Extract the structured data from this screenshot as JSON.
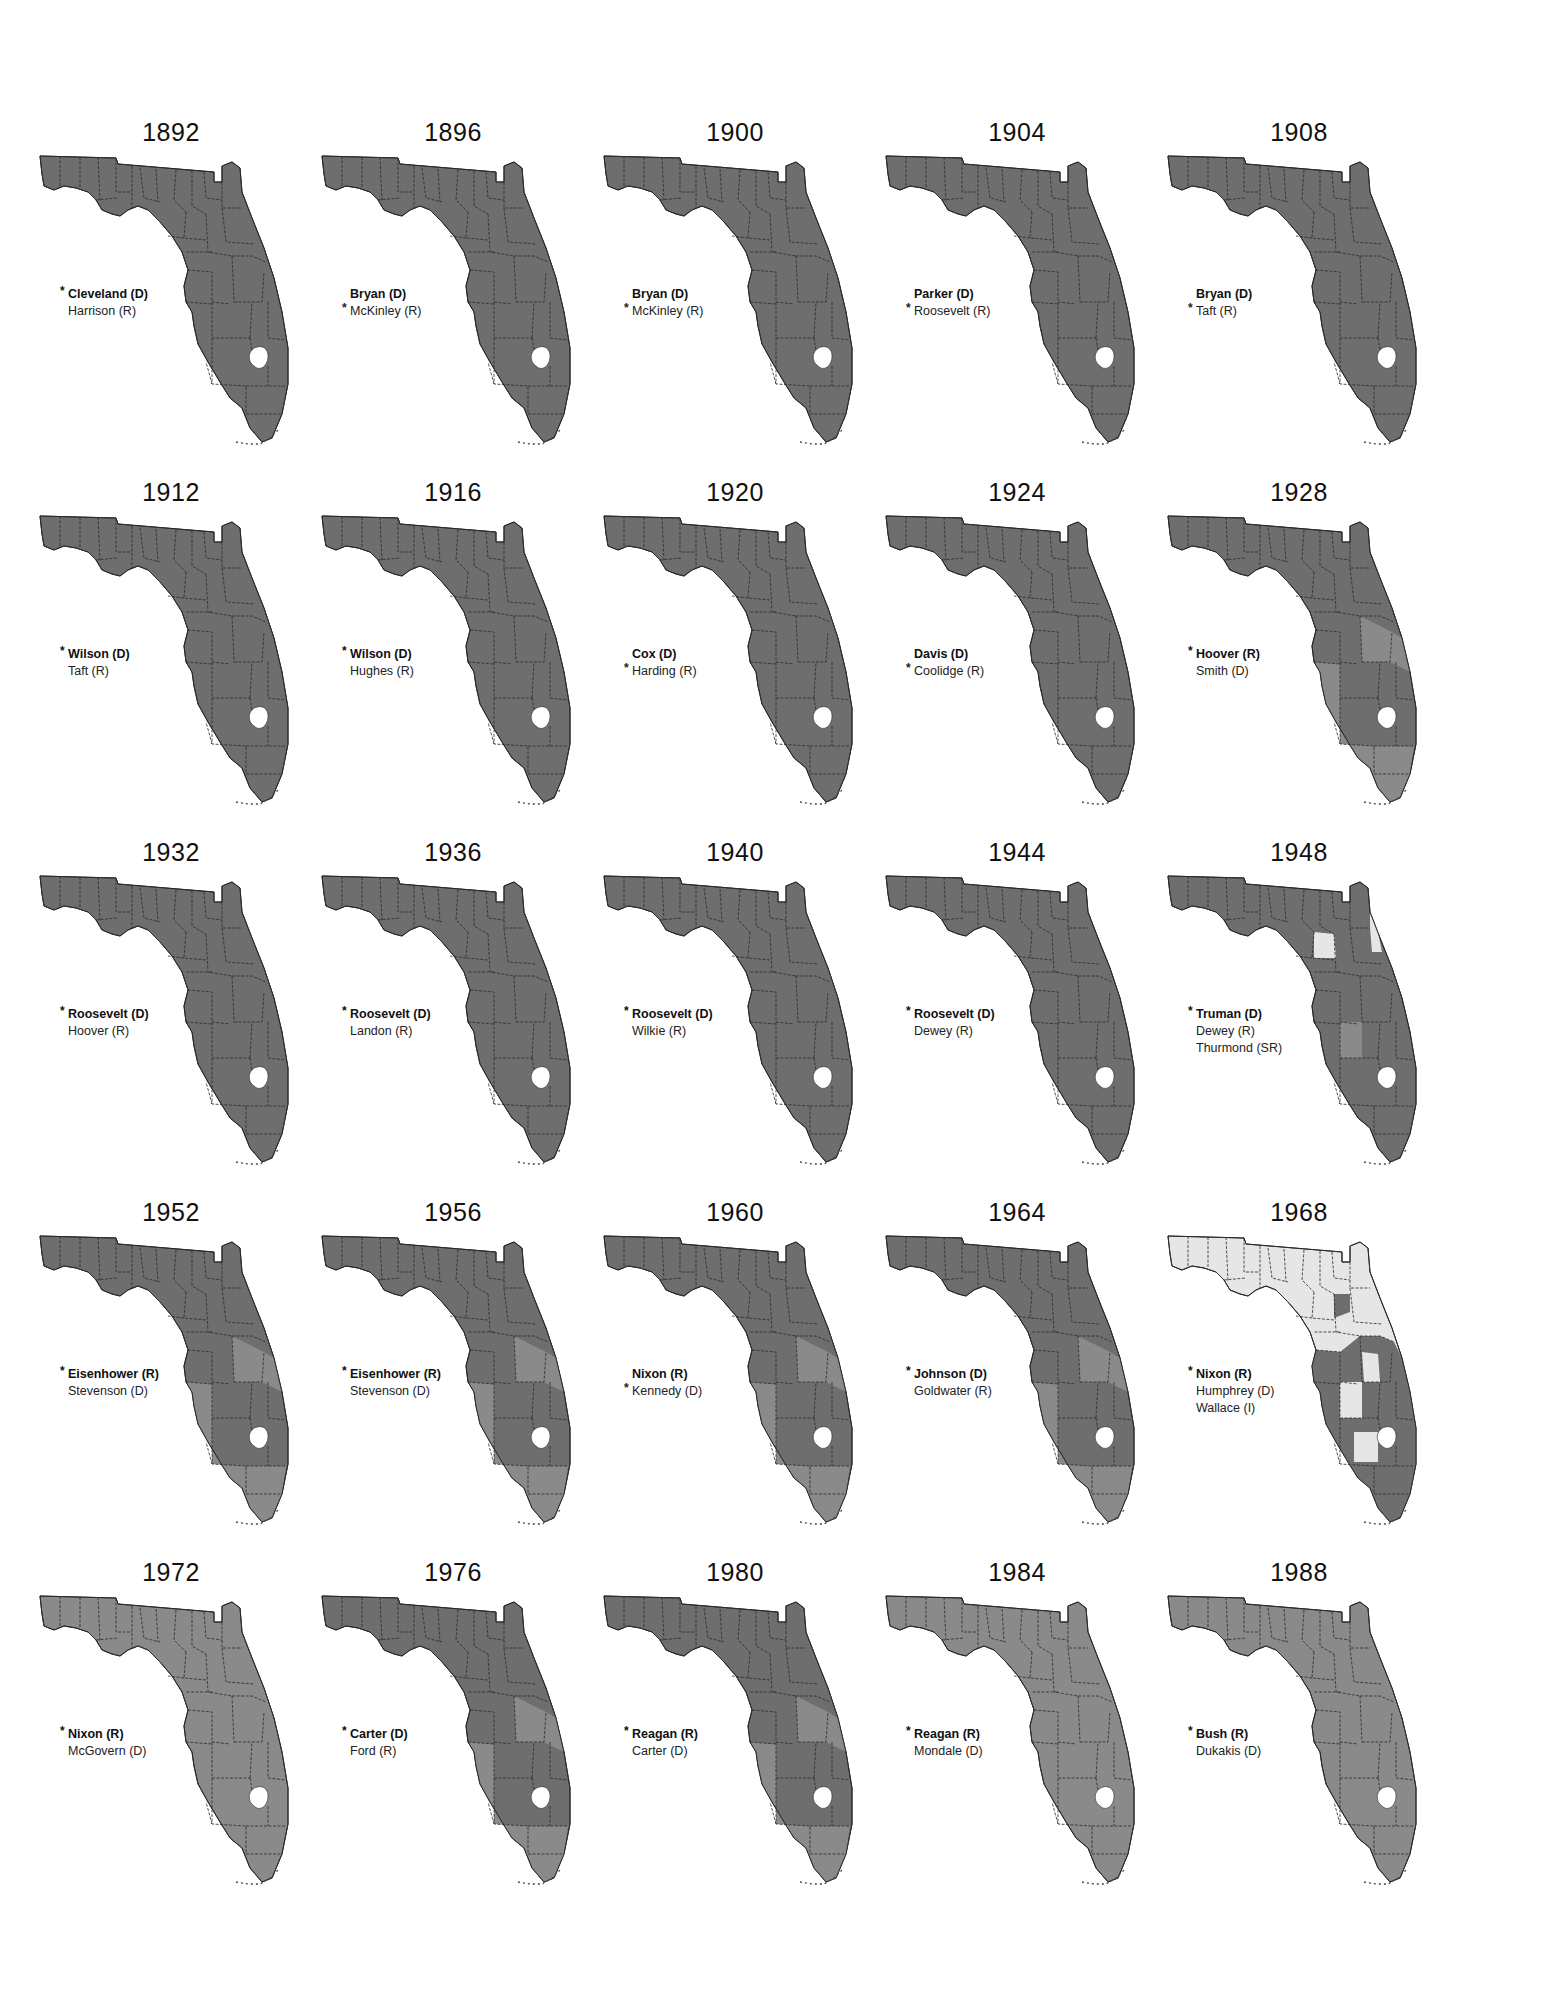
{
  "figure": {
    "winner_marker": "*",
    "colors": {
      "dark": "#6e6e6e",
      "medium": "#8a8a8a",
      "light": "#e6e6e6",
      "border": "#2a2a2a",
      "lake": "#ffffff"
    }
  },
  "elections": [
    {
      "year": "1892",
      "candidates": [
        {
          "name": "Cleveland (D)",
          "winner": true,
          "bold": true
        },
        {
          "name": "Harrison (R)",
          "winner": false,
          "bold": false
        }
      ],
      "shade": "dark"
    },
    {
      "year": "1896",
      "candidates": [
        {
          "name": "Bryan (D)",
          "winner": false,
          "bold": true
        },
        {
          "name": "McKinley (R)",
          "winner": true,
          "bold": false
        }
      ],
      "shade": "dark"
    },
    {
      "year": "1900",
      "candidates": [
        {
          "name": "Bryan (D)",
          "winner": false,
          "bold": true
        },
        {
          "name": "McKinley (R)",
          "winner": true,
          "bold": false
        }
      ],
      "shade": "dark"
    },
    {
      "year": "1904",
      "candidates": [
        {
          "name": "Parker (D)",
          "winner": false,
          "bold": true
        },
        {
          "name": "Roosevelt (R)",
          "winner": true,
          "bold": false
        }
      ],
      "shade": "dark"
    },
    {
      "year": "1908",
      "candidates": [
        {
          "name": "Bryan (D)",
          "winner": false,
          "bold": true
        },
        {
          "name": "Taft (R)",
          "winner": true,
          "bold": false
        }
      ],
      "shade": "dark"
    },
    {
      "year": "1912",
      "candidates": [
        {
          "name": "Wilson (D)",
          "winner": true,
          "bold": true
        },
        {
          "name": "Taft (R)",
          "winner": false,
          "bold": false
        }
      ],
      "shade": "dark"
    },
    {
      "year": "1916",
      "candidates": [
        {
          "name": "Wilson (D)",
          "winner": true,
          "bold": true
        },
        {
          "name": "Hughes (R)",
          "winner": false,
          "bold": false
        }
      ],
      "shade": "dark"
    },
    {
      "year": "1920",
      "candidates": [
        {
          "name": "Cox (D)",
          "winner": false,
          "bold": true
        },
        {
          "name": "Harding (R)",
          "winner": true,
          "bold": false
        }
      ],
      "shade": "dark"
    },
    {
      "year": "1924",
      "candidates": [
        {
          "name": "Davis (D)",
          "winner": false,
          "bold": true
        },
        {
          "name": "Coolidge (R)",
          "winner": true,
          "bold": false
        }
      ],
      "shade": "dark"
    },
    {
      "year": "1928",
      "candidates": [
        {
          "name": "Hoover (R)",
          "winner": true,
          "bold": true
        },
        {
          "name": "Smith (D)",
          "winner": false,
          "bold": false
        }
      ],
      "shade": "mixed"
    },
    {
      "year": "1932",
      "candidates": [
        {
          "name": "Roosevelt (D)",
          "winner": true,
          "bold": true
        },
        {
          "name": "Hoover (R)",
          "winner": false,
          "bold": false
        }
      ],
      "shade": "dark"
    },
    {
      "year": "1936",
      "candidates": [
        {
          "name": "Roosevelt (D)",
          "winner": true,
          "bold": true
        },
        {
          "name": "Landon (R)",
          "winner": false,
          "bold": false
        }
      ],
      "shade": "dark"
    },
    {
      "year": "1940",
      "candidates": [
        {
          "name": "Roosevelt (D)",
          "winner": true,
          "bold": true
        },
        {
          "name": "Wilkie (R)",
          "winner": false,
          "bold": false
        }
      ],
      "shade": "dark"
    },
    {
      "year": "1944",
      "candidates": [
        {
          "name": "Roosevelt (D)",
          "winner": true,
          "bold": true
        },
        {
          "name": "Dewey (R)",
          "winner": false,
          "bold": false
        }
      ],
      "shade": "dark"
    },
    {
      "year": "1948",
      "candidates": [
        {
          "name": "Truman (D)",
          "winner": true,
          "bold": true
        },
        {
          "name": "Dewey (R)",
          "winner": false,
          "bold": false
        },
        {
          "name": "Thurmond (SR)",
          "winner": false,
          "bold": false
        }
      ],
      "shade": "dark-with-light"
    },
    {
      "year": "1952",
      "candidates": [
        {
          "name": "Eisenhower (R)",
          "winner": true,
          "bold": true
        },
        {
          "name": "Stevenson (D)",
          "winner": false,
          "bold": false
        }
      ],
      "shade": "mixed"
    },
    {
      "year": "1956",
      "candidates": [
        {
          "name": "Eisenhower (R)",
          "winner": true,
          "bold": true
        },
        {
          "name": "Stevenson (D)",
          "winner": false,
          "bold": false
        }
      ],
      "shade": "mixed"
    },
    {
      "year": "1960",
      "candidates": [
        {
          "name": "Nixon (R)",
          "winner": false,
          "bold": true
        },
        {
          "name": "Kennedy (D)",
          "winner": true,
          "bold": false
        }
      ],
      "shade": "mixed"
    },
    {
      "year": "1964",
      "candidates": [
        {
          "name": "Johnson (D)",
          "winner": true,
          "bold": true
        },
        {
          "name": "Goldwater (R)",
          "winner": false,
          "bold": false
        }
      ],
      "shade": "mixed"
    },
    {
      "year": "1968",
      "candidates": [
        {
          "name": "Nixon (R)",
          "winner": true,
          "bold": true
        },
        {
          "name": "Humphrey (D)",
          "winner": false,
          "bold": false
        },
        {
          "name": "Wallace (I)",
          "winner": false,
          "bold": false
        }
      ],
      "shade": "light-north"
    },
    {
      "year": "1972",
      "candidates": [
        {
          "name": "Nixon (R)",
          "winner": true,
          "bold": true
        },
        {
          "name": "McGovern (D)",
          "winner": false,
          "bold": false
        }
      ],
      "shade": "medium"
    },
    {
      "year": "1976",
      "candidates": [
        {
          "name": "Carter (D)",
          "winner": true,
          "bold": true
        },
        {
          "name": "Ford (R)",
          "winner": false,
          "bold": false
        }
      ],
      "shade": "mixed"
    },
    {
      "year": "1980",
      "candidates": [
        {
          "name": "Reagan (R)",
          "winner": true,
          "bold": true
        },
        {
          "name": "Carter (D)",
          "winner": false,
          "bold": false
        }
      ],
      "shade": "mixed"
    },
    {
      "year": "1984",
      "candidates": [
        {
          "name": "Reagan (R)",
          "winner": true,
          "bold": true
        },
        {
          "name": "Mondale (D)",
          "winner": false,
          "bold": false
        }
      ],
      "shade": "medium"
    },
    {
      "year": "1988",
      "candidates": [
        {
          "name": "Bush (R)",
          "winner": true,
          "bold": true
        },
        {
          "name": "Dukakis (D)",
          "winner": false,
          "bold": false
        }
      ],
      "shade": "medium"
    }
  ]
}
